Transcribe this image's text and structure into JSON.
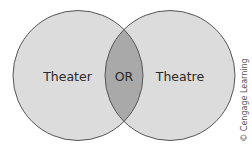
{
  "diagram": {
    "type": "venn",
    "sets": [
      {
        "label": "Theater"
      },
      {
        "label": "Theatre"
      }
    ],
    "intersection_label": "OR",
    "credit": "© Cengage Learning"
  },
  "colors": {
    "circle_fill": "#dcdcdc",
    "intersection_fill": "#a9a9a9",
    "stroke": "#555555",
    "text": "#2a2a2a",
    "background": "#ffffff"
  }
}
